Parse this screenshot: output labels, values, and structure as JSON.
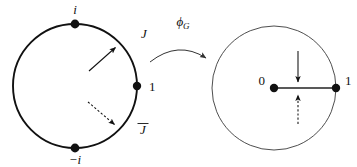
{
  "figure": {
    "background_color": "#ffffff",
    "ink_color": "#111111",
    "width": 357,
    "height": 167
  },
  "mapping_arrow": {
    "label_base": "ϕ",
    "label_subscript": "G",
    "label_full": "ϕG",
    "direction": "left-to-right",
    "style": "curved-arc-with-arrowhead"
  },
  "left_diagram": {
    "name": "source-unit-circle",
    "stroke_weight": "thick",
    "center": {
      "x": 75,
      "y": 86
    },
    "radius": 62,
    "points": [
      {
        "id": "i",
        "label": "i",
        "position": "top",
        "x": 75,
        "y": 24,
        "label_x": 75,
        "label_y": 13
      },
      {
        "id": "minus-i",
        "label": "−i",
        "position": "bottom",
        "x": 75,
        "y": 148,
        "label_x": 75,
        "label_y": 163
      },
      {
        "id": "one",
        "label": "1",
        "position": "right",
        "x": 137,
        "y": 86,
        "label_x": 150,
        "label_y": 91
      }
    ],
    "arc_labels": [
      {
        "id": "J",
        "label": "J",
        "x": 144,
        "y": 38
      },
      {
        "id": "J-bar",
        "label": "J̄",
        "base": "J",
        "overbar": true,
        "x": 143,
        "y": 133
      }
    ],
    "vectors": [
      {
        "id": "outward-solid",
        "style": "solid",
        "direction": "up-right",
        "from": {
          "x": 89,
          "y": 71
        },
        "to": {
          "x": 117,
          "y": 46
        }
      },
      {
        "id": "outward-dashed",
        "style": "dashed",
        "direction": "down-right",
        "from": {
          "x": 88,
          "y": 102
        },
        "to": {
          "x": 116,
          "y": 126
        }
      }
    ]
  },
  "right_diagram": {
    "name": "target-disc",
    "stroke_weight": "thin",
    "center": {
      "x": 274,
      "y": 88
    },
    "radius": 62,
    "points": [
      {
        "id": "zero",
        "label": "0",
        "position": "center",
        "x": 274,
        "y": 88,
        "label_x": 262,
        "label_y": 84
      },
      {
        "id": "one",
        "label": "1",
        "position": "right",
        "x": 336,
        "y": 88,
        "label_x": 348,
        "label_y": 84
      }
    ],
    "segments": [
      {
        "id": "radius-0-to-1",
        "from": {
          "x": 274,
          "y": 88
        },
        "to": {
          "x": 336,
          "y": 88
        }
      }
    ],
    "vectors": [
      {
        "id": "inward-solid",
        "style": "solid",
        "direction": "down",
        "from": {
          "x": 298,
          "y": 51
        },
        "to": {
          "x": 298,
          "y": 83
        }
      },
      {
        "id": "inward-dashed",
        "style": "dashed",
        "direction": "up",
        "from": {
          "x": 298,
          "y": 124
        },
        "to": {
          "x": 298,
          "y": 94
        }
      }
    ]
  }
}
